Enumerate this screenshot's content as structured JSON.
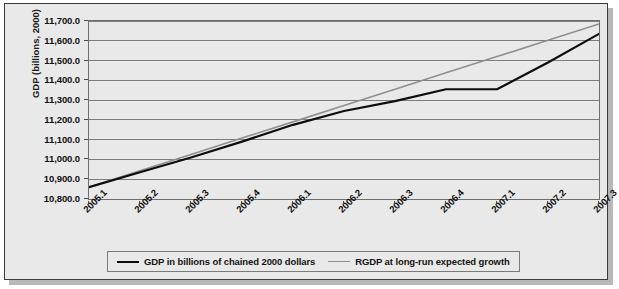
{
  "chart_data": {
    "type": "line",
    "title": "",
    "xlabel": "",
    "ylabel": "GDP (billions, 2000)",
    "ylim": [
      10800,
      11700
    ],
    "ytick_step": 100,
    "grid": true,
    "legend_position": "bottom",
    "categories": [
      "2005.1",
      "2005.2",
      "2005.3",
      "2005.4",
      "2006.1",
      "2006.2",
      "2006.3",
      "2006.4",
      "2007.1",
      "2007.2",
      "2007.3"
    ],
    "ytick_labels": [
      "11,700.0",
      "11,600.0",
      "11,500.0",
      "11,400.0",
      "11,300.0",
      "11,200.0",
      "11,100.0",
      "11,000.0",
      "10,900.0",
      "10,800.0"
    ],
    "ytick_values": [
      11700,
      11600,
      11500,
      11400,
      11300,
      11200,
      11100,
      11000,
      10900,
      10800
    ],
    "series": [
      {
        "name": "GDP in billions of chained 2000 dollars",
        "color": "#0d0d0d",
        "width": 2.2,
        "values": [
          10860,
          10935,
          11010,
          11090,
          11175,
          11245,
          11295,
          11355,
          11355,
          11490,
          11635
        ]
      },
      {
        "name": "RGDP at long-run expected growth",
        "color": "#8f8f8f",
        "width": 1.6,
        "values": [
          10860,
          10943,
          11025,
          11108,
          11190,
          11273,
          11355,
          11438,
          11520,
          11603,
          11685
        ]
      }
    ]
  },
  "legend": {
    "items": [
      {
        "label": "GDP in billions of chained 2000 dollars"
      },
      {
        "label": "RGDP at long-run expected growth"
      }
    ]
  },
  "axes": {
    "y_title": "GDP (billions, 2000)"
  },
  "colors": {
    "panel_background": "#e9e9e9",
    "frame_border": "#3b3b3b",
    "gridline": "#7d7d7d",
    "series_actual": "#0d0d0d",
    "series_trend": "#8f8f8f"
  }
}
